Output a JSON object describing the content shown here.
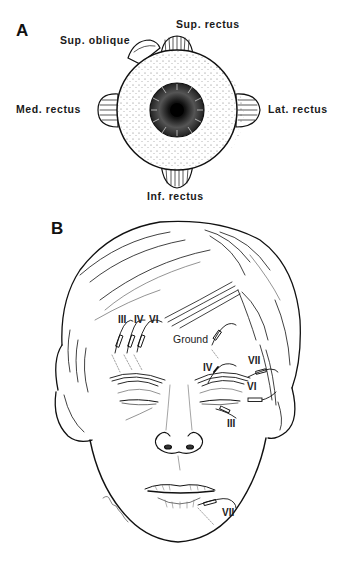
{
  "panel_a": {
    "letter": "A",
    "subject": "eyeball-anterior-view",
    "labels": {
      "sup_oblique": "Sup. oblique",
      "sup_rectus": "Sup. rectus",
      "med_rectus": "Med. rectus",
      "lat_rectus": "Lat. rectus",
      "inf_rectus": "Inf. rectus"
    }
  },
  "panel_b": {
    "letter": "B",
    "subject": "face-electrode-placement",
    "labels": {
      "left_group": [
        "III",
        "IV",
        "VI"
      ],
      "ground": "Ground",
      "right_iv": "IV",
      "right_vii_upper": "VII",
      "right_vi": "VI",
      "right_iii": "III",
      "chin_vii": "VII"
    }
  },
  "colors": {
    "ink": "#111111",
    "background": "#ffffff"
  }
}
